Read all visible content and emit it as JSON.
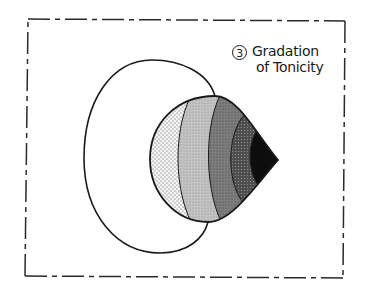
{
  "diagram": {
    "label": {
      "number": "3",
      "line1": "Gradation",
      "line2": "of Tonicity"
    },
    "frame": {
      "style": "dash-dot",
      "color": "#2a2a2a"
    },
    "zones": [
      {
        "name": "zone-1-light-dots",
        "fill": "#e8e8e8"
      },
      {
        "name": "zone-2-light-gray",
        "fill": "#bdbdbd"
      },
      {
        "name": "zone-3-mid-gray",
        "fill": "#7a7a7a"
      },
      {
        "name": "zone-4-dark-gray",
        "fill": "#4a4a4a"
      },
      {
        "name": "zone-5-black",
        "fill": "#0d0d0d"
      }
    ]
  }
}
